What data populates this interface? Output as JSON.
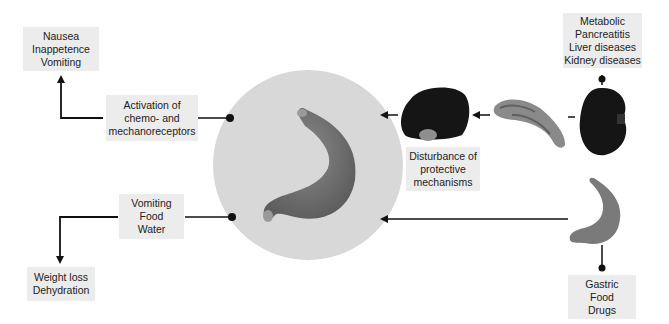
{
  "diagram": {
    "center": {
      "label": "Stomach (gastric mucosa)",
      "circle_color": "#d8d8d8"
    },
    "boxes": {
      "clinical_signs": {
        "lines": [
          "Nausea",
          "Inappetence",
          "Vomiting"
        ]
      },
      "receptors": {
        "lines": [
          "Activation of",
          "chemo- and",
          "mechanoreceptors"
        ]
      },
      "losses": {
        "lines": [
          "Vomiting",
          "Food",
          "Water"
        ]
      },
      "outcome": {
        "lines": [
          "Weight loss",
          "Dehydration"
        ]
      },
      "protective": {
        "lines": [
          "Disturbance of",
          "protective",
          "mechanisms"
        ]
      },
      "systemic_causes": {
        "lines": [
          "Metabolic",
          "Pancreatitis",
          "Liver diseases",
          "Kidney diseases"
        ]
      },
      "gastric_causes": {
        "lines": [
          "Gastric",
          "Food",
          "Drugs"
        ]
      }
    },
    "organs": [
      "stomach",
      "liver",
      "pancreas",
      "kidney",
      "small-stomach"
    ],
    "colors": {
      "box_bg": "#ececec",
      "line": "#111111",
      "circle": "#d8d8d8",
      "organ_dark": "#151515",
      "stomach": "#7d7d7d"
    }
  }
}
